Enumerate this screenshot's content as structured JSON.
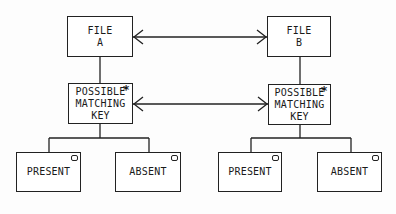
{
  "diagram": {
    "type": "jackson-structure-diagram",
    "nodes": {
      "file_a": {
        "label": "FILE\nA"
      },
      "file_b": {
        "label": "FILE\nB"
      },
      "pmk_a": {
        "label": "POSSIBLE\nMATCHING\nKEY",
        "marker": "*"
      },
      "pmk_b": {
        "label": "POSSIBLE\nMATCHING\nKEY",
        "marker": "*"
      },
      "present_a": {
        "label": "PRESENT",
        "marker": "o"
      },
      "absent_a": {
        "label": "ABSENT",
        "marker": "o"
      },
      "present_b": {
        "label": "PRESENT",
        "marker": "o"
      },
      "absent_b": {
        "label": "ABSENT",
        "marker": "o"
      }
    },
    "edges": [
      {
        "from": "file_a",
        "to": "file_b",
        "kind": "bidirectional-arrow"
      },
      {
        "from": "pmk_a",
        "to": "pmk_b",
        "kind": "bidirectional-arrow"
      },
      {
        "from": "file_a",
        "to": "pmk_a",
        "kind": "hierarchy"
      },
      {
        "from": "file_b",
        "to": "pmk_b",
        "kind": "hierarchy"
      },
      {
        "from": "pmk_a",
        "to": "present_a",
        "kind": "hierarchy"
      },
      {
        "from": "pmk_a",
        "to": "absent_a",
        "kind": "hierarchy"
      },
      {
        "from": "pmk_b",
        "to": "present_b",
        "kind": "hierarchy"
      },
      {
        "from": "pmk_b",
        "to": "absent_b",
        "kind": "hierarchy"
      }
    ],
    "colors": {
      "ink": "#222222",
      "paper": "#fdfdfd"
    }
  }
}
